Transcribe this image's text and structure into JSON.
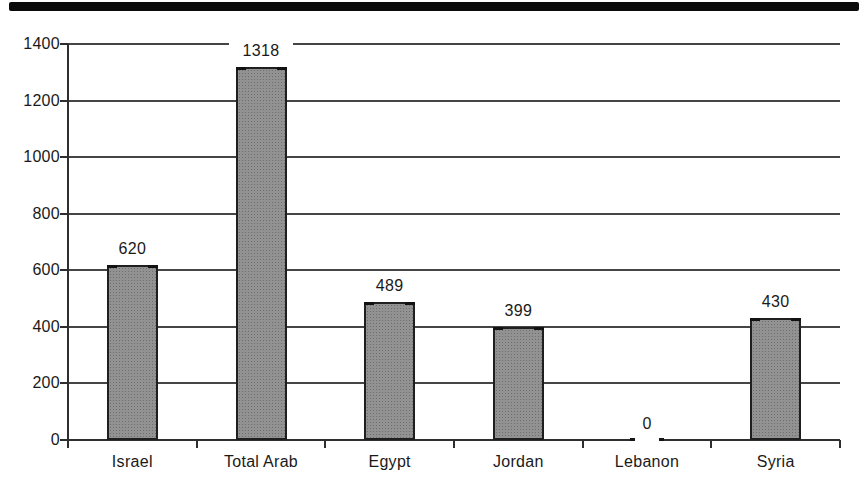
{
  "chart_data": {
    "type": "bar",
    "title": "",
    "categories": [
      "Israel",
      "Total Arab",
      "Egypt",
      "Jordan",
      "Lebanon",
      "Syria"
    ],
    "values": [
      620,
      1318,
      489,
      399,
      0,
      430
    ],
    "value_labels": [
      "620",
      "1318",
      "489",
      "399",
      "0",
      "430"
    ],
    "xlabel": "",
    "ylabel": "",
    "ylim": [
      0,
      1400
    ],
    "ytick_interval": 200,
    "ytick_labels": [
      "0",
      "200",
      "400",
      "600",
      "800",
      "1000",
      "1200",
      "1400"
    ],
    "grid": "horizontal-only",
    "legend": "none",
    "colors": {
      "bar_fill": "#929292",
      "bar_border": "#1f1f1f",
      "axis_line": "#2e2e2e",
      "gridline": "#454545",
      "text": "#1a1a1a",
      "background": "#ffffff",
      "scan_edge_bar": "#0b0b0b"
    }
  }
}
